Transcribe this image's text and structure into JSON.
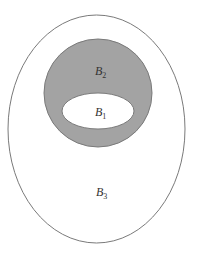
{
  "diagram": {
    "type": "nested-sets",
    "colors": {
      "background": "#ffffff",
      "outline": "#7a7a7a",
      "shaded_fill": "#a3a3a3",
      "label": "#333333"
    },
    "sets": [
      {
        "id": "B3",
        "label_main": "B",
        "label_sub": "3",
        "shape": "ellipse",
        "fill": "#ffffff",
        "cx": 96.5,
        "cy": 129,
        "rx": 88.5,
        "ry": 114,
        "label_x": 96,
        "label_y": 196
      },
      {
        "id": "B2",
        "label_main": "B",
        "label_sub": "2",
        "shape": "circle",
        "fill": "#a3a3a3",
        "cx": 98,
        "cy": 93,
        "rx": 54,
        "ry": 54,
        "label_x": 95,
        "label_y": 75
      },
      {
        "id": "B1",
        "label_main": "B",
        "label_sub": "1",
        "shape": "ellipse",
        "fill": "#ffffff",
        "cx": 98,
        "cy": 111,
        "rx": 36,
        "ry": 18,
        "label_x": 95,
        "label_y": 116
      }
    ]
  }
}
